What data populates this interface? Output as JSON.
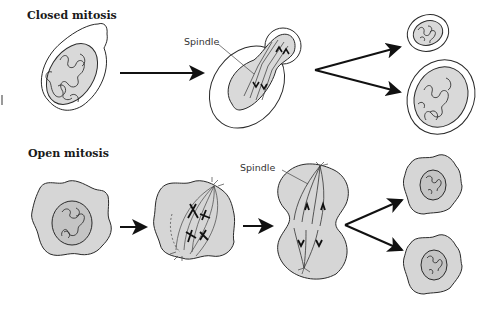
{
  "diagram": {
    "panels": [
      {
        "title": "Closed mitosis",
        "stages": [
          "interphase cell with intact nucleus",
          "dividing nucleus inside intact nuclear envelope",
          "two daughter cells"
        ],
        "labels": [
          {
            "text": "Spindle"
          }
        ]
      },
      {
        "title": "Open mitosis",
        "stages": [
          "interphase cell with nucleus",
          "nuclear envelope breakdown, spindle forms",
          "anaphase",
          "two daughter cells"
        ],
        "labels": [
          {
            "text": "Spindle"
          }
        ]
      }
    ],
    "colors": {
      "cell_fill": "#d6d6d6",
      "nucleus_fill": "#c4c4c4",
      "outline": "#2a2a2a",
      "arrow": "#111111",
      "background": "#ffffff"
    }
  }
}
